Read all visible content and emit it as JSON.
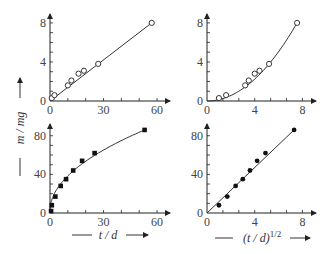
{
  "figure": {
    "y_axis_label": "m / mg",
    "x_axis_label_left": "t / d",
    "x_axis_label_right": "(t / d)",
    "x_axis_label_right_exp": "1/2"
  },
  "chart_data": [
    {
      "id": "top-left",
      "type": "scatter",
      "title": "",
      "xlabel": "t / d",
      "ylabel": "m / mg",
      "xlim": [
        0,
        65
      ],
      "ylim": [
        0,
        8.5
      ],
      "xticks": [
        "0",
        "30",
        "60"
      ],
      "yticks": [
        "0",
        "4",
        "8"
      ],
      "grid": false,
      "marker": "open-circle",
      "fit": "linear",
      "x": [
        1,
        2.5,
        10,
        12,
        16,
        19,
        27,
        57
      ],
      "y": [
        0.3,
        0.6,
        1.6,
        2.1,
        2.8,
        3.1,
        3.8,
        8.0
      ]
    },
    {
      "id": "top-right",
      "type": "scatter",
      "title": "",
      "xlabel": "(t / d)^1/2",
      "ylabel": "m / mg",
      "xlim": [
        0,
        8.8
      ],
      "ylim": [
        0,
        8.5
      ],
      "xticks": [
        "0",
        "4",
        "8"
      ],
      "yticks": [
        "0",
        "4",
        "8"
      ],
      "grid": false,
      "marker": "open-circle",
      "fit": "parabolic",
      "x": [
        1.0,
        1.6,
        3.2,
        3.5,
        4.0,
        4.4,
        5.2,
        7.55
      ],
      "y": [
        0.3,
        0.6,
        1.6,
        2.1,
        2.8,
        3.1,
        3.8,
        8.0
      ]
    },
    {
      "id": "bottom-left",
      "type": "scatter",
      "title": "",
      "xlabel": "t / d",
      "ylabel": "m / mg",
      "xlim": [
        0,
        65
      ],
      "ylim": [
        0,
        88
      ],
      "xticks": [
        "0",
        "30",
        "60"
      ],
      "yticks": [
        "0",
        "40",
        "80"
      ],
      "grid": false,
      "marker": "filled-square",
      "fit": "sqrt-curve",
      "x": [
        0.6,
        1,
        3,
        6,
        9,
        13,
        18,
        25,
        53
      ],
      "y": [
        2,
        8,
        17,
        28,
        35,
        44,
        54,
        62,
        86
      ]
    },
    {
      "id": "bottom-right",
      "type": "scatter",
      "title": "",
      "xlabel": "(t / d)^1/2",
      "ylabel": "m / mg",
      "xlim": [
        0,
        8.8
      ],
      "ylim": [
        0,
        88
      ],
      "xticks": [
        "0",
        "4",
        "8"
      ],
      "yticks": [
        "0",
        "40",
        "80"
      ],
      "grid": false,
      "marker": "filled-circle",
      "fit": "linear",
      "x": [
        1.0,
        1.7,
        2.4,
        3.0,
        3.6,
        4.2,
        4.9,
        7.3
      ],
      "y": [
        8,
        17,
        28,
        35,
        44,
        54,
        62,
        86
      ]
    }
  ]
}
